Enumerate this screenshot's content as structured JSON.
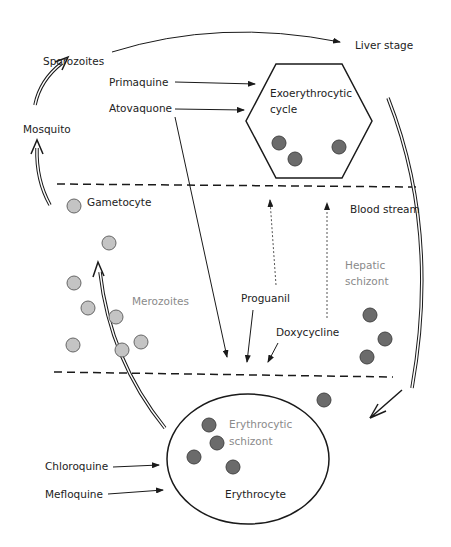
{
  "diagram": {
    "stages": {
      "sporozoites": "Sporozoites",
      "liver_stage": "Liver stage",
      "mosquito": "Mosquito",
      "exo_line1": "Exoerythrocytic",
      "exo_line2": "cycle",
      "gametocyte": "Gametocyte",
      "blood_stream": "Blood stream",
      "merozoites": "Merozoites",
      "hepatic_line1": "Hepatic",
      "hepatic_line2": "schizont",
      "ery_schizont_line1": "Erythrocytic",
      "ery_schizont_line2": "schizont",
      "erythrocyte": "Erythrocyte"
    },
    "drugs": {
      "primaquine": "Primaquine",
      "atovaquone": "Atovaquone",
      "proguanil": "Proguanil",
      "doxycycline": "Doxycycline",
      "chloroquine": "Chloroquine",
      "mefloquine": "Mefloquine"
    },
    "colors": {
      "dark_cell": "#6b6b6b",
      "light_cell": "#c4c4c4",
      "line": "#1a1a1a",
      "gray_text": "#8a8a8a"
    }
  }
}
